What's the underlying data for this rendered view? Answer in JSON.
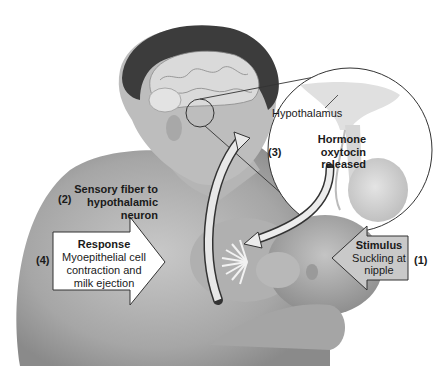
{
  "diagram": {
    "colors": {
      "skin_dark": "#8a8a8a",
      "skin_mid": "#a9a9a9",
      "skin_light": "#c6c6c6",
      "hair": "#3c3c3c",
      "brain": "#d9d9d9",
      "arrow_fill": "#e8e8e8",
      "stimulus_fill": "#c9c9c9",
      "response_fill": "#ffffff",
      "outline": "#333333"
    },
    "labels": {
      "hypothalamus": "Hypothalamus",
      "step3_number": "(3)",
      "step3_title": "Hormone",
      "step3_line1": "oxytocin",
      "step3_line2": "released",
      "step2_number": "(2)",
      "step2_line1": "Sensory fiber to",
      "step2_line2": "hypothalamic",
      "step2_line3": "neuron",
      "step4_number": "(4)",
      "step4_title": "Response",
      "step4_line1": "Myoepithelial cell",
      "step4_line2": "contraction and",
      "step4_line3": "milk ejection",
      "step1_number": "(1)",
      "step1_title": "Stimulus",
      "step1_line1": "Suckling at",
      "step1_line2": "nipple"
    }
  }
}
